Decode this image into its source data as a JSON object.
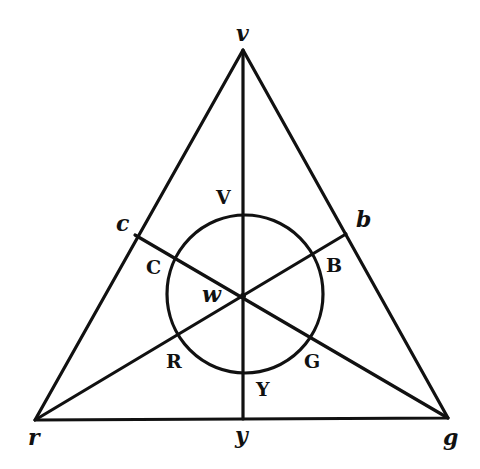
{
  "diagram": {
    "title": "",
    "stroke_color": "#111111",
    "background": "#ffffff",
    "points": {
      "v": {
        "x": 243,
        "y": 50
      },
      "r": {
        "x": 35,
        "y": 420
      },
      "g": {
        "x": 448,
        "y": 418
      },
      "y": {
        "x": 243,
        "y": 419
      },
      "c": {
        "x": 135,
        "y": 235
      },
      "b": {
        "x": 346,
        "y": 234
      },
      "w": {
        "x": 243,
        "y": 296
      }
    },
    "circle": {
      "cx": 245,
      "cy": 294,
      "rx": 78,
      "ry": 79
    },
    "labels": {
      "vertex_v": "v",
      "vertex_r": "r",
      "vertex_g": "g",
      "foot_y": "y",
      "foot_c": "c",
      "foot_b": "b",
      "center_w": "w",
      "circle_V": "V",
      "circle_C": "C",
      "circle_B": "B",
      "circle_R": "R",
      "circle_G": "G",
      "circle_Y": "Y"
    }
  }
}
